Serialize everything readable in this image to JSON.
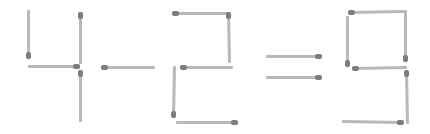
{
  "puzzle": {
    "equation_text": "4 - 2 = 9",
    "stick_color": "#b9b9b9",
    "head_color": "#7d7d7d",
    "background": "#ffffff",
    "glyphs": [
      {
        "name": "digit-4",
        "label": "4",
        "matches": [
          {
            "x1": 29,
            "y1": 10,
            "x2": 29,
            "y2": 59,
            "head": "end"
          },
          {
            "x1": 28,
            "y1": 66,
            "x2": 80,
            "y2": 66,
            "head": "end"
          },
          {
            "x1": 81,
            "y1": 12,
            "x2": 81,
            "y2": 64,
            "head": "start"
          },
          {
            "x1": 81,
            "y1": 70,
            "x2": 81,
            "y2": 122,
            "head": "start"
          }
        ]
      },
      {
        "name": "minus-sign",
        "label": "-",
        "matches": [
          {
            "x1": 101,
            "y1": 67,
            "x2": 155,
            "y2": 67,
            "head": "start"
          }
        ]
      },
      {
        "name": "digit-2",
        "label": "2",
        "matches": [
          {
            "x1": 172,
            "y1": 13,
            "x2": 230,
            "y2": 13,
            "head": "start"
          },
          {
            "x1": 229,
            "y1": 12,
            "x2": 230,
            "y2": 63,
            "head": "start"
          },
          {
            "x1": 180,
            "y1": 67,
            "x2": 233,
            "y2": 67,
            "head": "start"
          },
          {
            "x1": 175,
            "y1": 66,
            "x2": 174,
            "y2": 118,
            "head": "end"
          },
          {
            "x1": 176,
            "y1": 122,
            "x2": 238,
            "y2": 122,
            "head": "end"
          }
        ]
      },
      {
        "name": "equals-sign",
        "label": "=",
        "matches": [
          {
            "x1": 266,
            "y1": 56,
            "x2": 322,
            "y2": 56,
            "head": "end"
          },
          {
            "x1": 266,
            "y1": 77,
            "x2": 322,
            "y2": 77,
            "head": "end"
          }
        ]
      },
      {
        "name": "digit-9",
        "label": "9",
        "matches": [
          {
            "x1": 348,
            "y1": 12,
            "x2": 404,
            "y2": 11,
            "head": "start"
          },
          {
            "x1": 348,
            "y1": 16,
            "x2": 348,
            "y2": 67,
            "head": "end"
          },
          {
            "x1": 406,
            "y1": 10,
            "x2": 406,
            "y2": 62,
            "head": "end"
          },
          {
            "x1": 352,
            "y1": 68,
            "x2": 407,
            "y2": 67,
            "head": "start"
          },
          {
            "x1": 407,
            "y1": 70,
            "x2": 408,
            "y2": 124,
            "head": "start"
          },
          {
            "x1": 342,
            "y1": 121,
            "x2": 404,
            "y2": 122,
            "head": "end"
          }
        ]
      }
    ]
  }
}
